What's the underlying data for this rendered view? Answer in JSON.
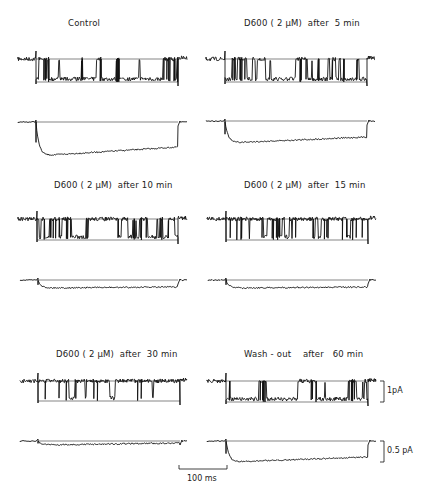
{
  "chart_data": {
    "type": "line",
    "title": "",
    "panels": [
      {
        "id": "control",
        "title": "Control",
        "col": 0,
        "row": 0,
        "single": {
          "x0": 18,
          "x1": 187,
          "pulse_on": 36,
          "pulse_off": 178,
          "base_y": 59,
          "open_y": 82,
          "activity": "high",
          "gaps": []
        },
        "avg": {
          "x0": 18,
          "x1": 187,
          "pulse_on": 36,
          "pulse_off": 178,
          "base_y": 122,
          "peak_y": 156,
          "end_y": 147
        }
      },
      {
        "id": "d600-5min",
        "title": "D600 ( 2 µM)  after  5 min",
        "col": 1,
        "row": 0,
        "single": {
          "x0": 206,
          "x1": 375,
          "pulse_on": 225,
          "pulse_off": 367,
          "base_y": 59,
          "open_y": 82,
          "activity": "high",
          "gaps": [
            [
              258,
              265
            ]
          ]
        },
        "avg": {
          "x0": 206,
          "x1": 375,
          "pulse_on": 225,
          "pulse_off": 367,
          "base_y": 121,
          "peak_y": 143,
          "end_y": 137
        }
      },
      {
        "id": "d600-10min",
        "title": "D600 ( 2 µM)  after 10 min",
        "col": 0,
        "row": 1,
        "single": {
          "x0": 18,
          "x1": 187,
          "pulse_on": 37,
          "pulse_off": 178,
          "base_y": 219,
          "open_y": 240,
          "activity": "medium",
          "gaps": [
            [
              62,
              66
            ],
            [
              88,
              117
            ]
          ]
        },
        "avg": {
          "x0": 20,
          "x1": 187,
          "pulse_on": 38,
          "pulse_off": 178,
          "base_y": 280,
          "peak_y": 288,
          "end_y": 287
        }
      },
      {
        "id": "d600-15min",
        "title": "D600 ( 2 µM)  after  15 min",
        "col": 1,
        "row": 1,
        "single": {
          "x0": 207,
          "x1": 376,
          "pulse_on": 226,
          "pulse_off": 368,
          "base_y": 219,
          "open_y": 240,
          "activity": "sparse",
          "gaps": []
        },
        "avg": {
          "x0": 208,
          "x1": 376,
          "pulse_on": 226,
          "pulse_off": 368,
          "base_y": 280,
          "peak_y": 288,
          "end_y": 287
        }
      },
      {
        "id": "d600-30min",
        "title": "D600 ( 2 µM)  after  30 min",
        "col": 0,
        "row": 2,
        "single": {
          "x0": 20,
          "x1": 187,
          "pulse_on": 38,
          "pulse_off": 180,
          "base_y": 381,
          "open_y": 401,
          "activity": "very-sparse",
          "gaps": []
        },
        "avg": {
          "x0": 20,
          "x1": 187,
          "pulse_on": 38,
          "pulse_off": 180,
          "base_y": 441,
          "peak_y": 445,
          "end_y": 443
        }
      },
      {
        "id": "washout-60min",
        "title": "Wash - out    after   60 min",
        "col": 1,
        "row": 2,
        "single": {
          "x0": 207,
          "x1": 376,
          "pulse_on": 226,
          "pulse_off": 368,
          "base_y": 381,
          "open_y": 402,
          "activity": "high",
          "gaps": [
            [
              298,
              311
            ]
          ]
        },
        "avg": {
          "x0": 207,
          "x1": 376,
          "pulse_on": 226,
          "pulse_off": 368,
          "base_y": 441,
          "peak_y": 462,
          "end_y": 457
        }
      }
    ],
    "scale_bars": {
      "time": {
        "label": "100 ms",
        "x1": 179,
        "x2": 227,
        "y": 469
      },
      "current_single": {
        "label": "1pA",
        "x": 380,
        "y1": 381,
        "y2": 402
      },
      "current_avg": {
        "label": "0.5 pA",
        "x": 380,
        "y1": 441,
        "y2": 462
      }
    },
    "xlabel": "",
    "ylabel": "",
    "grid": false,
    "legend": "none"
  }
}
